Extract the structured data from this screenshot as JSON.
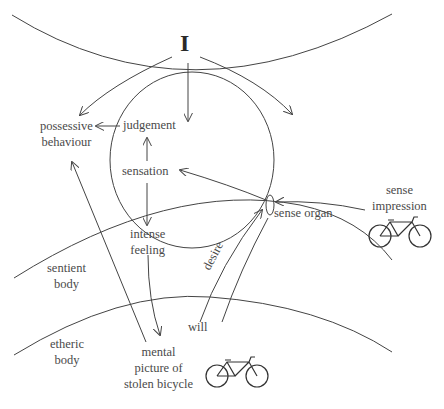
{
  "diagram": {
    "self_label": "I",
    "labels": {
      "judgement": "judgement",
      "possessive": [
        "possessive",
        "behaviour"
      ],
      "sensation": "sensation",
      "intense_feeling": [
        "intense",
        "feeling"
      ],
      "sense_organ": "sense organ",
      "sense_impression": [
        "sense",
        "impression"
      ],
      "desire": "desire",
      "will": "will",
      "sentient_body": [
        "sentient",
        "body"
      ],
      "etheric_body": [
        "etheric",
        "body"
      ],
      "mental_picture": [
        "mental",
        "picture of",
        "stolen bicycle"
      ]
    },
    "icons": [
      "bicycle-icon",
      "bicycle-icon"
    ],
    "colors": {
      "stroke": "#444444",
      "text": "#4a4a4a",
      "background": "#ffffff"
    }
  }
}
